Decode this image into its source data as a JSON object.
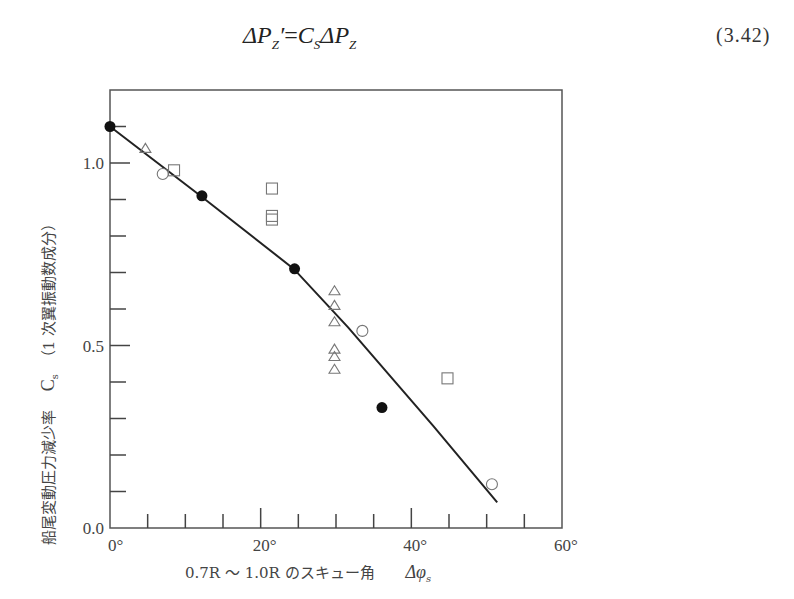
{
  "equation": {
    "lhs": "ΔP",
    "lhs_sub": "Z",
    "lhs_prime": "′",
    "equals": "=",
    "rhs_coef": "C",
    "rhs_coef_sub": "S",
    "rhs": "ΔP",
    "rhs_sub": "Z",
    "number": "(3.42)"
  },
  "chart_data": {
    "type": "scatter",
    "title": "",
    "xlabel": "0.7R ～ 1.0R のスキュー角　Δφs",
    "xlabel_parts": {
      "main": "0.7R ～ 1.0R のスキュー角",
      "symbol": "Δφ",
      "symbol_sub": "s"
    },
    "ylabel": "船尾変動圧力減少率　Cs（1 次翼振動数成分）",
    "ylabel_parts": {
      "main": "船尾変動圧力減少率",
      "symbol": "C",
      "symbol_sub": "s",
      "suffix": "（1 次翼振動数成分）"
    },
    "xlim": [
      0,
      60
    ],
    "ylim": [
      0.0,
      1.2
    ],
    "x_ticks": [
      0,
      20,
      40,
      60
    ],
    "x_tick_labels": [
      "0°",
      "20°",
      "40°",
      "60°"
    ],
    "x_minor_step": 5,
    "y_ticks": [
      0.0,
      0.5,
      1.0
    ],
    "y_tick_labels": [
      "0.0",
      "0.5",
      "1.0"
    ],
    "y_minor_step": 0.1,
    "grid": false,
    "legend": null,
    "series": [
      {
        "name": "filled-circle",
        "marker": "filled_circle",
        "points": [
          [
            0,
            1.1
          ],
          [
            12.2,
            0.91
          ],
          [
            24.5,
            0.71
          ],
          [
            36.1,
            0.33
          ]
        ]
      },
      {
        "name": "open-circle",
        "marker": "open_circle",
        "points": [
          [
            7.0,
            0.97
          ],
          [
            33.5,
            0.54
          ],
          [
            50.7,
            0.12
          ]
        ]
      },
      {
        "name": "open-square",
        "marker": "open_square",
        "points": [
          [
            8.5,
            0.98
          ],
          [
            21.5,
            0.93
          ],
          [
            21.5,
            0.855
          ],
          [
            21.5,
            0.845
          ],
          [
            44.8,
            0.41
          ]
        ]
      },
      {
        "name": "open-triangle",
        "marker": "open_triangle",
        "points": [
          [
            4.7,
            1.04
          ],
          [
            29.8,
            0.65
          ],
          [
            29.8,
            0.61
          ],
          [
            29.8,
            0.565
          ],
          [
            29.8,
            0.49
          ],
          [
            29.8,
            0.47
          ],
          [
            29.8,
            0.435
          ]
        ]
      },
      {
        "name": "fit-curve",
        "marker": "line",
        "points": [
          [
            0,
            1.1
          ],
          [
            12,
            0.91
          ],
          [
            24.4,
            0.71
          ],
          [
            31.6,
            0.55
          ],
          [
            42.9,
            0.28
          ],
          [
            51.4,
            0.07
          ]
        ]
      }
    ]
  }
}
